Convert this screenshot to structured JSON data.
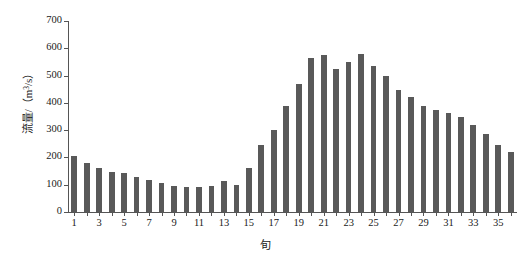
{
  "chart_data": {
    "type": "bar",
    "title": "",
    "xlabel": "旬",
    "ylabel": "流量/(m³/s)",
    "ylabel_parts": {
      "prefix": "流量/（m",
      "exponent": "3",
      "suffix": "/s）"
    },
    "categories": [
      1,
      2,
      3,
      4,
      5,
      6,
      7,
      8,
      9,
      10,
      11,
      12,
      13,
      14,
      15,
      16,
      17,
      18,
      19,
      20,
      21,
      22,
      23,
      24,
      25,
      26,
      27,
      28,
      29,
      30,
      31,
      32,
      33,
      34,
      35,
      36
    ],
    "values": [
      205,
      180,
      162,
      145,
      143,
      128,
      118,
      105,
      97,
      92,
      90,
      95,
      112,
      100,
      160,
      245,
      300,
      388,
      470,
      565,
      575,
      525,
      550,
      580,
      535,
      500,
      448,
      420,
      390,
      375,
      362,
      350,
      320,
      285,
      245,
      220
    ],
    "ylim": [
      0,
      700
    ],
    "ytick_values": [
      0,
      100,
      200,
      300,
      400,
      500,
      600,
      700
    ],
    "xtick_labels": [
      "1",
      "3",
      "5",
      "7",
      "9",
      "11",
      "13",
      "15",
      "17",
      "19",
      "21",
      "23",
      "25",
      "27",
      "29",
      "31",
      "33",
      "35"
    ],
    "xtick_categories": [
      1,
      3,
      5,
      7,
      9,
      11,
      13,
      15,
      17,
      19,
      21,
      23,
      25,
      27,
      29,
      31,
      33,
      35
    ],
    "grid": false,
    "legend": false,
    "bar_color": "#595959",
    "axis_color": "#555555"
  }
}
